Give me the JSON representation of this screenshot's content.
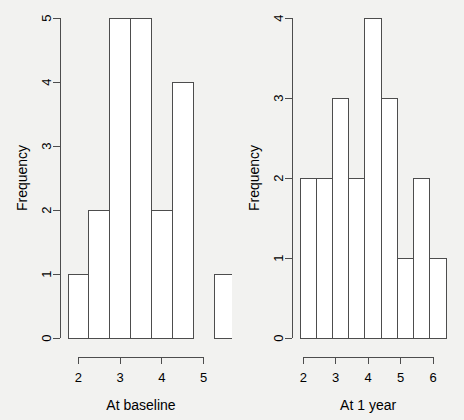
{
  "figure": {
    "background_color": "#f2f2f0",
    "line_color": "#4d4d4d",
    "bar_fill_color": "#ffffff",
    "panels": 2,
    "layout": "1 row x 2 columns"
  },
  "chart_data": [
    {
      "type": "bar",
      "subtype": "histogram",
      "panel": "left",
      "title": "",
      "xlabel": "At baseline",
      "ylabel": "Frequency",
      "xlim": [
        1.75,
        5.25
      ],
      "ylim": [
        0,
        5
      ],
      "xticks": [
        2,
        3,
        4,
        5
      ],
      "xtick_labels": [
        "2",
        "3",
        "4",
        "5"
      ],
      "yticks": [
        0,
        1,
        2,
        3,
        4,
        5
      ],
      "ytick_labels": [
        "0",
        "1",
        "2",
        "3",
        "4",
        "5"
      ],
      "grid": false,
      "legend": "none",
      "bin_width": 0.5,
      "bin_edges": [
        1.75,
        2.25,
        2.75,
        3.25,
        3.75,
        4.25,
        4.75,
        5.25
      ],
      "bin_starts": [
        1.75,
        2.25,
        2.75,
        3.25,
        3.75,
        4.25,
        4.75
      ],
      "values": [
        1,
        2,
        5,
        5,
        2,
        4,
        0,
        1
      ],
      "bars": [
        {
          "x0": 1.75,
          "x1": 2.25,
          "height": 1
        },
        {
          "x0": 2.25,
          "x1": 2.75,
          "height": 2
        },
        {
          "x0": 2.75,
          "x1": 3.25,
          "height": 5
        },
        {
          "x0": 3.25,
          "x1": 3.75,
          "height": 5
        },
        {
          "x0": 3.75,
          "x1": 4.25,
          "height": 2
        },
        {
          "x0": 4.25,
          "x1": 4.75,
          "height": 4
        },
        {
          "x0": 4.75,
          "x1": 5.25,
          "height": 0
        },
        {
          "x0": 5.25,
          "x1": 5.75,
          "height": 1
        }
      ]
    },
    {
      "type": "bar",
      "subtype": "histogram",
      "panel": "right",
      "title": "",
      "xlabel": "At 1 year",
      "ylabel": "Frequency",
      "xlim": [
        1.9,
        6.4
      ],
      "ylim": [
        0,
        4
      ],
      "xticks": [
        2,
        3,
        4,
        5,
        6
      ],
      "xtick_labels": [
        "2",
        "3",
        "4",
        "5",
        "6"
      ],
      "yticks": [
        0,
        1,
        2,
        3,
        4
      ],
      "ytick_labels": [
        "0",
        "1",
        "2",
        "3",
        "4"
      ],
      "grid": false,
      "legend": "none",
      "bin_width": 0.5,
      "bin_edges": [
        1.9,
        2.4,
        2.9,
        3.4,
        3.9,
        4.4,
        4.9,
        5.4,
        5.9,
        6.4
      ],
      "values": [
        2,
        2,
        3,
        2,
        4,
        3,
        1,
        2,
        1
      ],
      "bars": [
        {
          "x0": 1.9,
          "x1": 2.4,
          "height": 2
        },
        {
          "x0": 2.4,
          "x1": 2.9,
          "height": 2
        },
        {
          "x0": 2.9,
          "x1": 3.4,
          "height": 3
        },
        {
          "x0": 3.4,
          "x1": 3.9,
          "height": 2
        },
        {
          "x0": 3.9,
          "x1": 4.4,
          "height": 4
        },
        {
          "x0": 4.4,
          "x1": 4.9,
          "height": 3
        },
        {
          "x0": 4.9,
          "x1": 5.4,
          "height": 1
        },
        {
          "x0": 5.4,
          "x1": 5.9,
          "height": 2
        },
        {
          "x0": 5.9,
          "x1": 6.4,
          "height": 1
        }
      ]
    }
  ]
}
